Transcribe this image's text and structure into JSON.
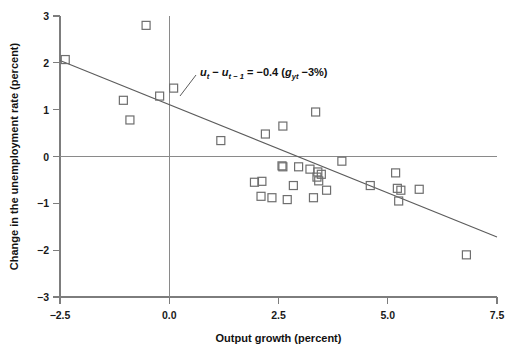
{
  "chart_data": {
    "type": "scatter",
    "title": "",
    "xlabel": "Output growth (percent)",
    "ylabel": "Change in the unemployment rate (percent)",
    "xlim": [
      -2.5,
      7.5
    ],
    "ylim": [
      -3,
      3
    ],
    "xticks": [
      "-2.5",
      "0.0",
      "2.5",
      "5.0",
      "7.5"
    ],
    "xtick_values": [
      -2.5,
      0.0,
      2.5,
      5.0,
      7.5
    ],
    "yticks": [
      "3",
      "2",
      "1",
      "0",
      "-1",
      "-2",
      "-3"
    ],
    "ytick_values": [
      3,
      2,
      1,
      0,
      -1,
      -2,
      -3
    ],
    "grid": false,
    "legend": null,
    "marker": "open-square",
    "annotation": {
      "text": "u_t - u_(t-1) = -0.4 (g_yt - 3%)",
      "parts": {
        "u1": "u",
        "sub1": "t",
        "minus": " − ",
        "u2": "u",
        "sub2": "t − 1",
        "equals": " = ",
        "coefficient": "−0.4 (",
        "g": "g",
        "gsub": "yt",
        "tail": " −3%)"
      }
    },
    "fit_line": {
      "label": "Okun's law regression line",
      "slope": -0.4,
      "intercept": 1.2,
      "x_start": -2.5,
      "y_start": 2.05,
      "x_end": 7.5,
      "y_end": -1.72
    },
    "points": [
      {
        "x": -2.38,
        "y": 2.07
      },
      {
        "x": -0.53,
        "y": 2.8
      },
      {
        "x": -1.05,
        "y": 1.2
      },
      {
        "x": -0.9,
        "y": 0.78
      },
      {
        "x": -0.22,
        "y": 1.29
      },
      {
        "x": 0.1,
        "y": 1.46
      },
      {
        "x": 1.18,
        "y": 0.34
      },
      {
        "x": 2.2,
        "y": 0.48
      },
      {
        "x": 2.6,
        "y": 0.65
      },
      {
        "x": 3.35,
        "y": 0.95
      },
      {
        "x": 3.95,
        "y": -0.1
      },
      {
        "x": 2.12,
        "y": -0.53
      },
      {
        "x": 2.1,
        "y": -0.85
      },
      {
        "x": 2.58,
        "y": -0.2
      },
      {
        "x": 2.6,
        "y": -0.22
      },
      {
        "x": 2.96,
        "y": -0.22
      },
      {
        "x": 3.22,
        "y": -0.27
      },
      {
        "x": 3.4,
        "y": -0.33
      },
      {
        "x": 3.38,
        "y": -0.44
      },
      {
        "x": 3.42,
        "y": -0.52
      },
      {
        "x": 3.48,
        "y": -0.38
      },
      {
        "x": 2.84,
        "y": -0.62
      },
      {
        "x": 2.7,
        "y": -0.92
      },
      {
        "x": 3.3,
        "y": -0.88
      },
      {
        "x": 3.6,
        "y": -0.72
      },
      {
        "x": 4.6,
        "y": -0.62
      },
      {
        "x": 5.18,
        "y": -0.35
      },
      {
        "x": 5.3,
        "y": -0.72
      },
      {
        "x": 5.25,
        "y": -0.95
      },
      {
        "x": 5.22,
        "y": -0.68
      },
      {
        "x": 5.72,
        "y": -0.7
      },
      {
        "x": 6.8,
        "y": -2.1
      },
      {
        "x": 1.95,
        "y": -0.55
      },
      {
        "x": 2.35,
        "y": -0.88
      }
    ]
  }
}
